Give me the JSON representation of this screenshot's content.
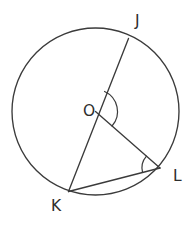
{
  "figure": {
    "type": "geometry-diagram",
    "background_color": "#ffffff",
    "stroke_color": "#3b3b3b",
    "label_color": "#2e2e2e",
    "canvas": {
      "width": 191,
      "height": 227
    },
    "circle": {
      "name": "circle-o",
      "center_x": 95.5,
      "center_y": 111.5,
      "radius": 83.5
    },
    "points": [
      {
        "id": "J",
        "label": "J",
        "x": 128.5,
        "y": 38.5,
        "label_x": 135,
        "label_y": 26
      },
      {
        "id": "O",
        "label": "O",
        "x": 95.5,
        "y": 111.5,
        "label_x": 83,
        "label_y": 116
      },
      {
        "id": "K",
        "label": "K",
        "x": 68.5,
        "y": 191.5,
        "label_x": 51,
        "label_y": 211
      },
      {
        "id": "L",
        "label": "L",
        "x": 160.0,
        "y": 168.0,
        "label_x": 173,
        "label_y": 181
      }
    ],
    "segments": [
      {
        "name": "diameter-jk",
        "from": "J",
        "to": "K"
      },
      {
        "name": "radius-ol",
        "from": "O",
        "to": "L"
      },
      {
        "name": "chord-kl",
        "from": "K",
        "to": "L"
      }
    ],
    "angle_marks": [
      {
        "name": "angle-mark-o",
        "vertex": "O",
        "radius": 22,
        "between": [
          "J",
          "L"
        ]
      },
      {
        "name": "angle-mark-l",
        "vertex": "L",
        "radius": 18,
        "between": [
          "O",
          "K"
        ]
      }
    ]
  }
}
